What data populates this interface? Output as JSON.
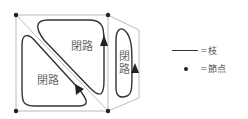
{
  "diagram": {
    "loops": [
      {
        "label": "閉路",
        "position": "upper-right-triangle"
      },
      {
        "label": "閉路",
        "position": "lower-left-triangle"
      },
      {
        "label": "閉路",
        "position": "right-pentagon",
        "vertical": true
      }
    ],
    "colors": {
      "branch": "#aaaaaa",
      "loop": "#333333",
      "node": "#222222",
      "text": "#666666"
    }
  },
  "legend": {
    "branch": {
      "symbol": "——",
      "label": "=枝"
    },
    "node": {
      "symbol": "•",
      "label": "=節点"
    }
  }
}
